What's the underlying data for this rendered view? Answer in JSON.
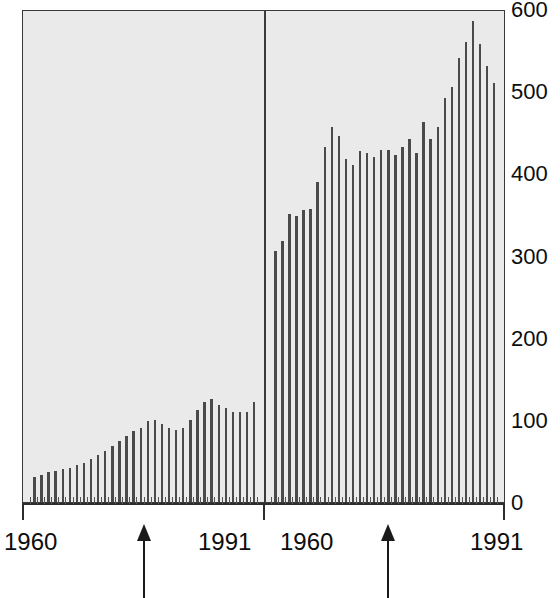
{
  "chart_data": {
    "type": "bar",
    "title": "",
    "subtitle": "",
    "xlabel": "",
    "ylabel": "",
    "ylim": [
      0,
      600
    ],
    "ytick_labels": [
      "0",
      "100",
      "200",
      "300",
      "400",
      "500",
      "600"
    ],
    "ytick_values": [
      0,
      100,
      200,
      300,
      400,
      500,
      600
    ],
    "grid": false,
    "legend": "none",
    "panels": [
      {
        "name": "left-panel",
        "x_start_label": "1960",
        "x_end_label": "1991",
        "x": [
          1960,
          1961,
          1962,
          1963,
          1964,
          1965,
          1966,
          1967,
          1968,
          1969,
          1970,
          1971,
          1972,
          1973,
          1974,
          1975,
          1976,
          1977,
          1978,
          1979,
          1980,
          1981,
          1982,
          1983,
          1984,
          1985,
          1986,
          1987,
          1988,
          1989,
          1990,
          1991
        ],
        "values": [
          31,
          33,
          36,
          38,
          40,
          42,
          45,
          48,
          52,
          57,
          62,
          68,
          74,
          80,
          86,
          90,
          99,
          100,
          95,
          90,
          88,
          90,
          100,
          112,
          122,
          125,
          118,
          115,
          110,
          110,
          110,
          122
        ],
        "annotation": {
          "type": "up-arrow",
          "year": 1973
        }
      },
      {
        "name": "right-panel",
        "x_start_label": "1960",
        "x_end_label": "1991",
        "x": [
          1960,
          1961,
          1962,
          1963,
          1964,
          1965,
          1966,
          1967,
          1968,
          1969,
          1970,
          1971,
          1972,
          1973,
          1974,
          1975,
          1976,
          1977,
          1978,
          1979,
          1980,
          1981,
          1982,
          1983,
          1984,
          1985,
          1986,
          1987,
          1988,
          1989,
          1990,
          1991
        ],
        "values": [
          305,
          318,
          350,
          348,
          356,
          357,
          389,
          432,
          456,
          445,
          418,
          410,
          427,
          425,
          420,
          428,
          429,
          422,
          432,
          442,
          425,
          462,
          442,
          457,
          492,
          505,
          540,
          560,
          585,
          557,
          531,
          510
        ],
        "annotation": {
          "type": "up-arrow",
          "year": 1973
        }
      }
    ],
    "colors": {
      "bar": "#4a4a4a",
      "panel_background": "#eaeaea",
      "frame": "#3a3a3a",
      "text": "#0d0d0d",
      "arrow": "#1a1a1a",
      "page_background": "#ffffff"
    }
  },
  "axis": {
    "y": {
      "labels": [
        "600",
        "500",
        "400",
        "300",
        "200",
        "100",
        "0"
      ],
      "values": [
        600,
        500,
        400,
        300,
        200,
        100,
        0
      ]
    },
    "x": {
      "left_start": "1960",
      "left_end": "1991",
      "right_start": "1960",
      "right_end": "1991"
    }
  },
  "annotations": {
    "left_arrow": {
      "name": "left-panel-arrow",
      "label": ""
    },
    "right_arrow": {
      "name": "right-panel-arrow",
      "label": ""
    }
  }
}
